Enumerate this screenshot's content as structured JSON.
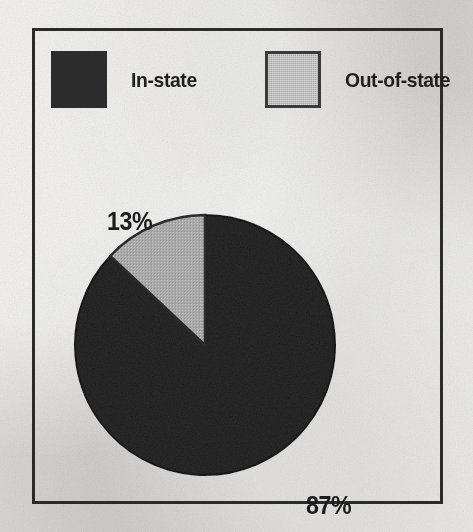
{
  "chart_data": {
    "type": "pie",
    "title": "",
    "categories": [
      "In-state",
      "Out-of-state"
    ],
    "values": [
      87,
      13
    ],
    "value_labels": [
      "87%",
      "13%"
    ],
    "units": "percent",
    "start_angle_deg": 0,
    "direction": "counterclockwise",
    "legend_position": "top",
    "grid": false,
    "colors": [
      "#2c2c2c",
      "#a8a8a8"
    ],
    "slices": [
      {
        "label": "In-state",
        "value": 87,
        "value_label": "87%",
        "color": "#2c2c2c",
        "sweep_deg": 313.2
      },
      {
        "label": "Out-of-state",
        "value": 13,
        "value_label": "13%",
        "color": "#a8a8a8",
        "sweep_deg": 46.8
      }
    ]
  },
  "legend": {
    "entries": [
      {
        "label": "In-state",
        "swatch_color": "#2c2c2c",
        "swatch_style": "solid-dark"
      },
      {
        "label": "Out-of-state",
        "swatch_color": "#a8a8a8",
        "swatch_style": "gray-outlined"
      }
    ]
  },
  "frame": {
    "border_color": "#2b2b2b",
    "background_color": "#dddcda"
  }
}
